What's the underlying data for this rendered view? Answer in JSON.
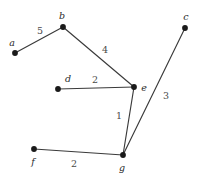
{
  "figure": {
    "background_color": "#ffffff",
    "edge_color": "#3a3a3a",
    "node_color": "#1a1a1a",
    "label_color": "#2b2b2b",
    "weight_color": "#4a4a4a",
    "width": 198,
    "height": 179
  },
  "graph": {
    "type": "weighted-undirected-graph",
    "nodes": [
      {
        "id": "a",
        "label": "a",
        "x": 15,
        "y": 53,
        "label_x": 12,
        "label_y": 43
      },
      {
        "id": "b",
        "label": "b",
        "x": 63,
        "y": 27,
        "label_x": 62,
        "label_y": 16
      },
      {
        "id": "c",
        "label": "c",
        "x": 185,
        "y": 28,
        "label_x": 186,
        "label_y": 17
      },
      {
        "id": "d",
        "label": "d",
        "x": 58,
        "y": 89,
        "label_x": 68,
        "label_y": 79
      },
      {
        "id": "e",
        "label": "e",
        "x": 134,
        "y": 87,
        "label_x": 144,
        "label_y": 88
      },
      {
        "id": "f",
        "label": "f",
        "x": 34,
        "y": 149,
        "label_x": 33,
        "label_y": 162
      },
      {
        "id": "g",
        "label": "g",
        "x": 123,
        "y": 155,
        "label_x": 122,
        "label_y": 168
      }
    ],
    "edges": [
      {
        "from": "a",
        "to": "b",
        "weight": "5",
        "label_x": 40,
        "label_y": 31
      },
      {
        "from": "b",
        "to": "e",
        "weight": "4",
        "label_x": 105,
        "label_y": 50
      },
      {
        "from": "d",
        "to": "e",
        "weight": "2",
        "label_x": 95,
        "label_y": 80
      },
      {
        "from": "e",
        "to": "g",
        "weight": "1",
        "label_x": 119,
        "label_y": 116
      },
      {
        "from": "c",
        "to": "g",
        "weight": "3",
        "label_x": 166,
        "label_y": 96
      },
      {
        "from": "f",
        "to": "g",
        "weight": "2",
        "label_x": 74,
        "label_y": 164
      }
    ]
  }
}
